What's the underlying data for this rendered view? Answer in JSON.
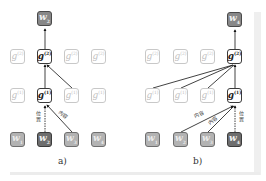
{
  "panels": [
    {
      "caption": "a)",
      "output": {
        "base": "w",
        "sub": "2"
      },
      "layer2": [
        {
          "base": "g",
          "sub": "1",
          "sup": "(2)",
          "state": "faded"
        },
        {
          "base": "g",
          "sub": "2",
          "sup": "(2)",
          "state": "active"
        },
        {
          "base": "g",
          "sub": "3",
          "sup": "(2)",
          "state": "faded"
        },
        {
          "base": "g",
          "sub": "4",
          "sup": "(2)",
          "state": "faded"
        }
      ],
      "layer1": [
        {
          "base": "g",
          "sub": "1",
          "sup": "(1)",
          "state": "faded"
        },
        {
          "base": "g",
          "sub": "2",
          "sup": "(1)",
          "state": "active"
        },
        {
          "base": "g",
          "sub": "3",
          "sup": "(1)",
          "state": "faded"
        },
        {
          "base": "g",
          "sub": "4",
          "sup": "(1)",
          "state": "faded"
        }
      ],
      "inputs": [
        {
          "base": "w",
          "sub": "1",
          "state": "light"
        },
        {
          "base": "w",
          "sub": "2",
          "state": "dark"
        },
        {
          "base": "w",
          "sub": "3",
          "state": "light"
        },
        {
          "base": "w",
          "sub": "4",
          "state": "light"
        }
      ],
      "labels": {
        "position": "位置",
        "content": "内容"
      }
    },
    {
      "caption": "b)",
      "output": {
        "base": "w",
        "sub": "4"
      },
      "layer2": [
        {
          "base": "g",
          "sub": "1",
          "sup": "(2)",
          "state": "faded"
        },
        {
          "base": "g",
          "sub": "2",
          "sup": "(2)",
          "state": "faded"
        },
        {
          "base": "g",
          "sub": "3",
          "sup": "(2)",
          "state": "faded"
        },
        {
          "base": "g",
          "sub": "4",
          "sup": "(2)",
          "state": "active"
        }
      ],
      "layer1": [
        {
          "base": "g",
          "sub": "1",
          "sup": "(1)",
          "state": "faded"
        },
        {
          "base": "g",
          "sub": "2",
          "sup": "(1)",
          "state": "faded"
        },
        {
          "base": "g",
          "sub": "3",
          "sup": "(1)",
          "state": "faded"
        },
        {
          "base": "g",
          "sub": "4",
          "sup": "(1)",
          "state": "active"
        }
      ],
      "inputs": [
        {
          "base": "w",
          "sub": "1",
          "state": "light"
        },
        {
          "base": "w",
          "sub": "2",
          "state": "light"
        },
        {
          "base": "w",
          "sub": "3",
          "state": "light"
        },
        {
          "base": "w",
          "sub": "4",
          "state": "dark"
        }
      ],
      "labels": {
        "position": "位置",
        "content1": "内容",
        "content2": "内容"
      }
    }
  ]
}
